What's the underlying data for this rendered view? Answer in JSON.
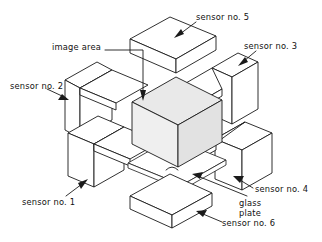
{
  "diagram": {
    "projection": "isometric",
    "background_color": "#ffffff",
    "line_color": "#1a1a1a",
    "cube_fill_color": "#e9e9e9"
  },
  "labels": {
    "image_area": "image area",
    "sensor_1": "sensor no. 1",
    "sensor_2": "sensor no. 2",
    "sensor_3": "sensor no. 3",
    "sensor_4": "sensor no. 4",
    "sensor_5": "sensor no. 5",
    "sensor_6": "sensor no. 6",
    "glass_plate_line1": "glass",
    "glass_plate_line2": "plate"
  },
  "parts": [
    {
      "id": "image-area-cube",
      "label": "image area",
      "shape": "cube",
      "position": "center",
      "shaded": true
    },
    {
      "id": "sensor-1",
      "label": "sensor no. 1",
      "shape": "box",
      "position": "front-left"
    },
    {
      "id": "sensor-2",
      "label": "sensor no. 2",
      "shape": "plate",
      "position": "back-left"
    },
    {
      "id": "sensor-3",
      "label": "sensor no. 3",
      "shape": "box",
      "position": "back-right"
    },
    {
      "id": "sensor-4",
      "label": "sensor no. 4",
      "shape": "box",
      "position": "front-right"
    },
    {
      "id": "sensor-5",
      "label": "sensor no. 5",
      "shape": "slab",
      "position": "top"
    },
    {
      "id": "sensor-6",
      "label": "sensor no. 6",
      "shape": "slab",
      "position": "bottom"
    },
    {
      "id": "glass-plate",
      "label": "glass plate",
      "shape": "thin-slab",
      "position": "under-cube"
    }
  ]
}
